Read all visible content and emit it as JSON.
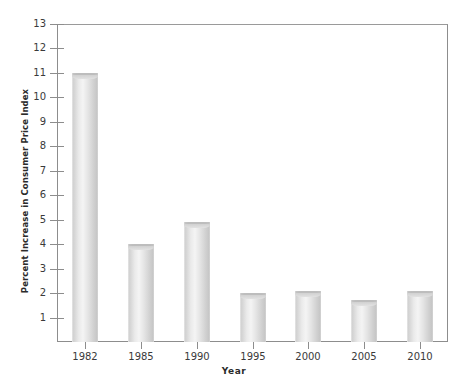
{
  "chart_data": {
    "type": "bar",
    "title": "",
    "subtitle": "",
    "xlabel": "Year",
    "ylabel": "Percent Increase in Consumer Price Index",
    "categories": [
      "1982",
      "1985",
      "1990",
      "1995",
      "2000",
      "2005",
      "2010"
    ],
    "values": [
      11.0,
      4.0,
      4.9,
      2.0,
      2.1,
      1.7,
      2.1
    ],
    "ylim": [
      0,
      13
    ],
    "ytick_labels": [
      "1",
      "2",
      "3",
      "4",
      "5",
      "6",
      "7",
      "8",
      "9",
      "10",
      "11",
      "12",
      "13"
    ],
    "ytick_values": [
      1,
      2,
      3,
      4,
      5,
      6,
      7,
      8,
      9,
      10,
      11,
      12,
      13
    ],
    "grid": false,
    "legend": null,
    "legend_position": "none",
    "bar_style": "cylinder",
    "bar_color": "#dcdcdc",
    "axis_color": "#8d8d8d",
    "text_color": "#2b2b2b",
    "background": "#ffffff"
  }
}
